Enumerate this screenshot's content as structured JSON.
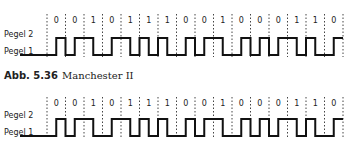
{
  "diagrams": [
    {
      "level_high_label": "Pegel 2",
      "level_low_label": "Pegel 1",
      "bits": [
        "0",
        "0",
        "1",
        "0",
        "1",
        "1",
        "1",
        "0",
        "0",
        "1",
        "0",
        "0",
        "0",
        "1",
        "1",
        "0"
      ]
    },
    {
      "level_high_label": "Pegel 2",
      "level_low_label": "Pegel 1",
      "bits": [
        "0",
        "0",
        "1",
        "0",
        "1",
        "1",
        "1",
        "0",
        "0",
        "1",
        "0",
        "0",
        "0",
        "1",
        "1",
        "0"
      ]
    }
  ],
  "caption": {
    "number": "Abb. 5.36",
    "title": "Manchester II"
  }
}
